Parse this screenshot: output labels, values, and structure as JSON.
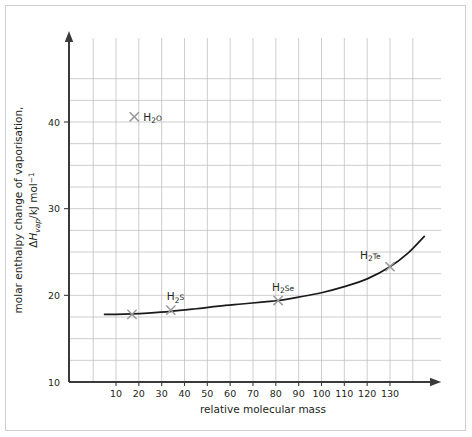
{
  "chart_data": {
    "type": "scatter",
    "title": "",
    "xlabel": "relative molecular mass",
    "ylabel_line1": "molar enthalpy change of vaporisation,",
    "ylabel_line2_prefix": "ΔH",
    "ylabel_line2_sub": "vap",
    "ylabel_line2_mid": "/kJ mol",
    "ylabel_line2_sup": "−1",
    "xlim": [
      0,
      140
    ],
    "ylim": [
      10,
      46
    ],
    "xticks": [
      10,
      20,
      30,
      40,
      50,
      60,
      70,
      80,
      90,
      100,
      110,
      120,
      130
    ],
    "yticks": [
      10,
      20,
      30,
      40
    ],
    "xtick_labels": [
      "10",
      "20",
      "30",
      "40",
      "50",
      "60",
      "70",
      "80",
      "90",
      "100",
      "110",
      "120",
      "130"
    ],
    "ytick_labels": [
      "10",
      "20",
      "30",
      "40"
    ],
    "grid": true,
    "grid_x_step": 10,
    "grid_y_step": 2.5,
    "grid_color": "#b9b9b9",
    "axis_color": "#3a3a3a",
    "curve_color": "#1a1a1a",
    "marker_color": "#9a9a9a",
    "marker_symbol": "x",
    "legend": "none",
    "points": [
      {
        "label": "",
        "formula_main": "",
        "x": 17,
        "y": 17.8,
        "show_label": false
      },
      {
        "label": "H2O",
        "formula_main": "H",
        "formula_sub": "2",
        "formula_tail": "O",
        "x": 18,
        "y": 40.6,
        "show_label": true,
        "label_dx": 9,
        "label_dy": 4
      },
      {
        "label": "H2S",
        "formula_main": "H",
        "formula_sub": "2",
        "formula_tail": "S",
        "x": 34,
        "y": 18.3,
        "show_label": true,
        "label_dx": -4,
        "label_dy": -10
      },
      {
        "label": "H2Se",
        "formula_main": "H",
        "formula_sub": "2",
        "formula_tail": "Se",
        "x": 81,
        "y": 19.4,
        "show_label": true,
        "label_dx": -6,
        "label_dy": -10
      },
      {
        "label": "H2Te",
        "formula_main": "H",
        "formula_sub": "2",
        "formula_tail": "Te",
        "x": 130,
        "y": 23.3,
        "show_label": true,
        "label_dx": -30,
        "label_dy": -8
      }
    ],
    "curve": {
      "description": "trend line through H2S, H2Se, H2Te extrapolated back to low mass",
      "x_start": 5,
      "x_end": 145,
      "series_x": [
        5,
        10,
        17,
        24,
        34,
        45,
        55,
        65,
        75,
        81,
        90,
        100,
        110,
        120,
        130,
        138,
        145
      ],
      "series_y": [
        17.8,
        17.8,
        17.85,
        17.95,
        18.15,
        18.45,
        18.75,
        19.0,
        19.25,
        19.4,
        19.8,
        20.3,
        21.0,
        21.9,
        23.3,
        24.9,
        26.8
      ]
    }
  },
  "figure": {
    "border_color": "#cfcfcf",
    "background": "#ffffff"
  }
}
